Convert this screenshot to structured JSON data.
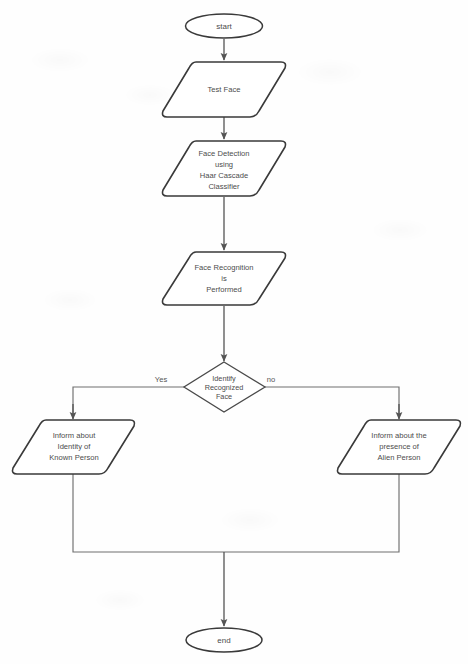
{
  "diagram": {
    "type": "flowchart",
    "background_color": "#ffffff",
    "stroke_color": "#3a3a3a",
    "connector_color": "#6e6e6e",
    "text_color": "#4c4c4c"
  },
  "nodes": {
    "start": {
      "label": "start",
      "shape": "terminator-ellipse"
    },
    "test_face": {
      "label": "Test Face",
      "shape": "parallelogram",
      "lines": [
        "Test Face"
      ]
    },
    "face_detection": {
      "shape": "parallelogram",
      "lines": [
        "Face Detection",
        "using",
        "Haar Cascade",
        "Classifier"
      ]
    },
    "face_recognition": {
      "shape": "parallelogram",
      "lines": [
        "Face Recognition",
        "is",
        "Performed"
      ]
    },
    "decision": {
      "shape": "diamond",
      "lines": [
        "Identify",
        "Recognized",
        "Face"
      ]
    },
    "known_person": {
      "shape": "parallelogram",
      "lines": [
        "Inform about",
        "Identity of",
        "Known Person"
      ]
    },
    "alien_person": {
      "shape": "parallelogram",
      "lines": [
        "Inform about the",
        "presence of",
        "Alien Person"
      ]
    },
    "end": {
      "label": "end",
      "shape": "terminator-ellipse"
    }
  },
  "edges": {
    "yes_label": "Yes",
    "no_label": "no"
  }
}
